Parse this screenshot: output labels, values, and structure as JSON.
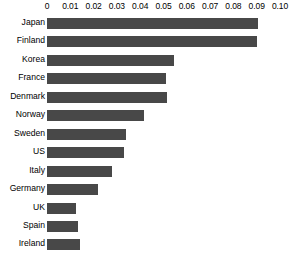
{
  "chart_data": {
    "type": "bar",
    "orientation": "horizontal",
    "title": "",
    "subtitle": "",
    "xlabel": "",
    "ylabel": "",
    "categories": [
      "Japan",
      "Finland",
      "Korea",
      "France",
      "Denmark",
      "Norway",
      "Sweden",
      "US",
      "Italy",
      "Germany",
      "UK",
      "Spain",
      "Ireland"
    ],
    "values": [
      0.0905,
      0.09,
      0.0545,
      0.051,
      0.0515,
      0.0416,
      0.0339,
      0.033,
      0.0279,
      0.0219,
      0.0124,
      0.0133,
      0.0142
    ],
    "xlim": [
      0,
      0.1
    ],
    "xticks": [
      0,
      0.01,
      0.02,
      0.03,
      0.04,
      0.05,
      0.06,
      0.07,
      0.08,
      0.09,
      0.1
    ],
    "xticklabels": [
      "0",
      "0.01",
      "0.02",
      "0.03",
      "0.04",
      "0.05",
      "0.06",
      "0.07",
      "0.08",
      "0.09",
      "0.10"
    ],
    "axis_position": "top",
    "grid": false,
    "legend": null,
    "bar_color": "#484848",
    "background_color": "#ffffff",
    "text_color": "#000000"
  }
}
